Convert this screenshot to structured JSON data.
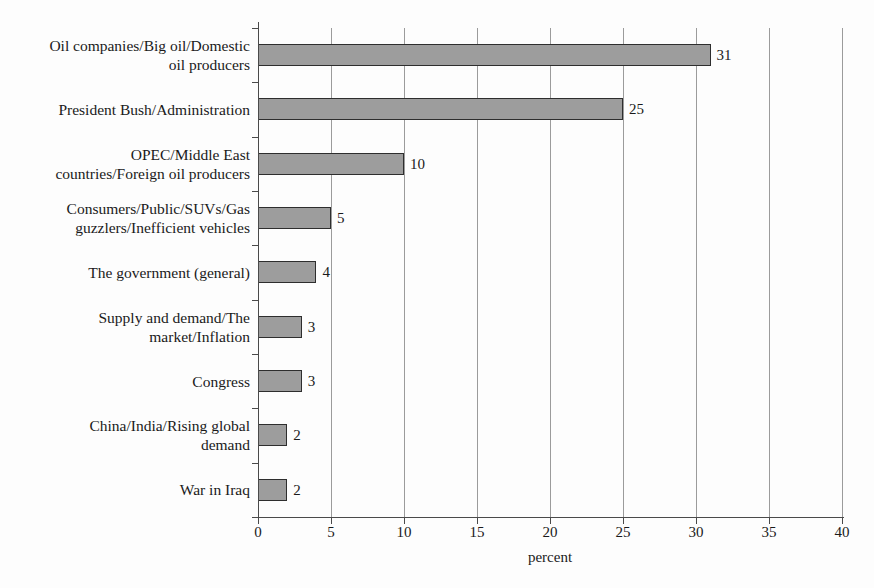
{
  "chart_data": {
    "type": "bar",
    "orientation": "horizontal",
    "title": "",
    "subtitle": "",
    "xlabel": "percent",
    "ylabel": "",
    "xlim": [
      0,
      40
    ],
    "xticks": [
      0,
      5,
      10,
      15,
      20,
      25,
      30,
      35,
      40
    ],
    "xtick_labels": [
      "0",
      "5",
      "10",
      "15",
      "20",
      "25",
      "30",
      "35",
      "40"
    ],
    "grid": "vertical",
    "legend": null,
    "bar_color": "#9d9d9d",
    "bar_edge_color": "#2e2e2e",
    "grid_color": "#9b9b9b",
    "axis_color": "#4a4a4a",
    "background_color": "#fdfdfd",
    "categories": [
      "Oil companies/Big oil/Domestic oil producers",
      "President Bush/Administration",
      "OPEC/Middle East countries/Foreign oil producers",
      "Consumers/Public/SUVs/Gas guzzlers/Inefficient vehicles",
      "The government (general)",
      "Supply and demand/The market/Inflation",
      "Congress",
      "China/India/Rising global demand",
      "War in Iraq"
    ],
    "category_lines": [
      [
        "Oil companies/Big oil/Domestic",
        "oil producers"
      ],
      [
        "President Bush/Administration"
      ],
      [
        "OPEC/Middle East",
        "countries/Foreign oil producers"
      ],
      [
        "Consumers/Public/SUVs/Gas",
        "guzzlers/Inefficient vehicles"
      ],
      [
        "The government (general)"
      ],
      [
        "Supply and demand/The",
        "market/Inflation"
      ],
      [
        "Congress"
      ],
      [
        "China/India/Rising global",
        "demand"
      ],
      [
        "War in Iraq"
      ]
    ],
    "values": [
      31,
      25,
      10,
      5,
      4,
      3,
      3,
      2,
      2
    ],
    "value_labels": [
      "31",
      "25",
      "10",
      "5",
      "4",
      "3",
      "3",
      "2",
      "2"
    ]
  }
}
